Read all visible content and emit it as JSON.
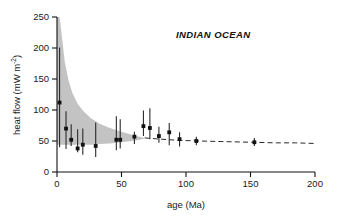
{
  "figure": {
    "panel_title": "INDIAN OCEAN",
    "background_color": "#ffffff",
    "envelope_color": "#b6b6b6",
    "marker_color": "#111111",
    "curve_color": "#2a2a2a"
  },
  "axes": {
    "x": {
      "title": "age (Ma)",
      "unit": "Ma",
      "min": 0,
      "max": 200,
      "ticks": [
        0,
        50,
        100,
        150,
        200
      ],
      "tick_labels": [
        "0",
        "50",
        "100",
        "150",
        "200"
      ]
    },
    "y": {
      "title_main": "heat flow (mW m",
      "title_sup": "-2",
      "title_close": ")",
      "title_full": "heat flow (mW m-2)",
      "unit": "mW m-2",
      "min": 0,
      "max": 250,
      "ticks": [
        0,
        50,
        100,
        150,
        200,
        250
      ],
      "tick_labels": [
        "0",
        "50",
        "100",
        "150",
        "200",
        "250"
      ]
    }
  },
  "chart_data": {
    "type": "scatter",
    "title": "INDIAN OCEAN",
    "xlabel": "age (Ma)",
    "ylabel": "heat flow (mW m-2)",
    "xlim": [
      0,
      200
    ],
    "ylim": [
      0,
      250
    ],
    "grid": false,
    "legend": null,
    "series": [
      {
        "name": "measured heat flow",
        "type": "scatter_errorbar",
        "marker": "square",
        "x": [
          2,
          7,
          11,
          16,
          20,
          30,
          46,
          49,
          60,
          67,
          72,
          79,
          87,
          95,
          108,
          153
        ],
        "y": [
          112,
          70,
          52,
          38,
          44,
          42,
          52,
          52,
          57,
          74,
          71,
          58,
          64,
          53,
          50,
          48
        ],
        "yerr_low": [
          72,
          33,
          10,
          6,
          16,
          18,
          17,
          14,
          12,
          16,
          18,
          11,
          21,
          12,
          7,
          6
        ],
        "yerr_high": [
          89,
          28,
          25,
          31,
          26,
          38,
          38,
          33,
          8,
          25,
          32,
          15,
          15,
          11,
          7,
          7
        ]
      },
      {
        "name": "theoretical cooling curve",
        "type": "line",
        "style": "dashed",
        "x": [
          68,
          80,
          95,
          110,
          130,
          150,
          170,
          185,
          200
        ],
        "y": [
          55,
          53,
          51,
          50,
          49,
          48,
          47,
          47,
          46
        ]
      }
    ],
    "envelope": {
      "name": "model heat flow envelope",
      "fill": "#b6b6b6",
      "x": [
        0,
        2,
        4,
        6,
        9,
        12,
        16,
        20,
        26,
        33,
        41,
        50,
        58,
        64,
        68
      ],
      "upper": [
        250,
        250,
        215,
        178,
        147,
        127,
        110,
        99,
        87,
        78,
        71,
        65,
        60,
        57,
        55
      ],
      "lower": [
        44,
        44,
        44,
        44,
        44,
        44,
        44,
        44,
        44,
        45,
        46,
        48,
        50,
        52,
        54
      ]
    }
  }
}
